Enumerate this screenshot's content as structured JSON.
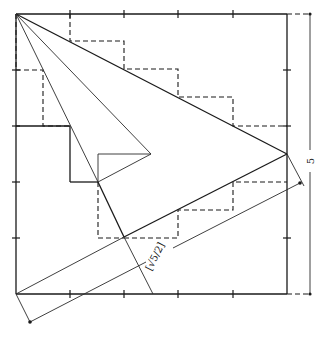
{
  "figure": {
    "square_side_label": "5",
    "diagonal_dimension_label": "[√5/2]",
    "grid_divisions": 5
  }
}
